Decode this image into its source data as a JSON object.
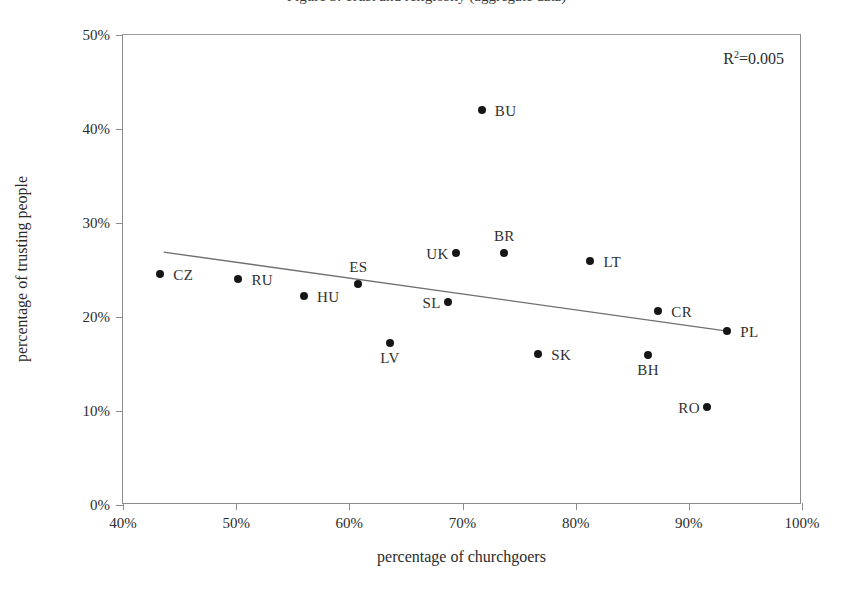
{
  "top_caption": "Figure 3. Trust and religiosity (aggregate data)",
  "chart_data": {
    "type": "scatter",
    "title": "",
    "xlabel": "percentage of churchgoers",
    "ylabel": "percentage of trusting people",
    "xlim": [
      40,
      100
    ],
    "ylim": [
      0,
      50
    ],
    "xticks": [
      "40%",
      "50%",
      "60%",
      "70%",
      "80%",
      "90%",
      "100%"
    ],
    "xtick_values": [
      40,
      50,
      60,
      70,
      80,
      90,
      100
    ],
    "yticks": [
      "0%",
      "10%",
      "20%",
      "30%",
      "40%",
      "50%"
    ],
    "ytick_values": [
      0,
      10,
      20,
      30,
      40,
      50
    ],
    "grid": false,
    "legend": "none",
    "annotation": "R2=0.005",
    "annotation_r": "R",
    "annotation_sup": "2",
    "annotation_rest": "=0.005",
    "marker_color": "#161616",
    "trendline_color": "#707070",
    "axis_color": "#8c8c8c",
    "trendline": {
      "x0": 43.6,
      "y0": 26.9,
      "x1": 93.4,
      "y1": 18.5
    },
    "points": [
      {
        "label": "CZ",
        "x": 43.3,
        "y": 24.6,
        "label_pos": "right"
      },
      {
        "label": "RU",
        "x": 50.2,
        "y": 24.0,
        "label_pos": "right"
      },
      {
        "label": "HU",
        "x": 56.0,
        "y": 22.2,
        "label_pos": "right"
      },
      {
        "label": "ES",
        "x": 60.8,
        "y": 23.5,
        "label_pos": "above"
      },
      {
        "label": "LV",
        "x": 63.6,
        "y": 17.2,
        "label_pos": "below"
      },
      {
        "label": "SL",
        "x": 68.7,
        "y": 21.6,
        "label_pos": "left"
      },
      {
        "label": "UK",
        "x": 69.4,
        "y": 26.8,
        "label_pos": "left"
      },
      {
        "label": "BU",
        "x": 71.7,
        "y": 42.0,
        "label_pos": "right"
      },
      {
        "label": "BR",
        "x": 73.7,
        "y": 26.8,
        "label_pos": "above"
      },
      {
        "label": "SK",
        "x": 76.7,
        "y": 16.1,
        "label_pos": "right"
      },
      {
        "label": "LT",
        "x": 81.3,
        "y": 26.0,
        "label_pos": "right"
      },
      {
        "label": "BH",
        "x": 86.4,
        "y": 16.0,
        "label_pos": "below"
      },
      {
        "label": "CR",
        "x": 87.3,
        "y": 20.6,
        "label_pos": "right"
      },
      {
        "label": "RO",
        "x": 91.6,
        "y": 10.4,
        "label_pos": "left"
      },
      {
        "label": "PL",
        "x": 93.4,
        "y": 18.5,
        "label_pos": "right"
      }
    ]
  }
}
